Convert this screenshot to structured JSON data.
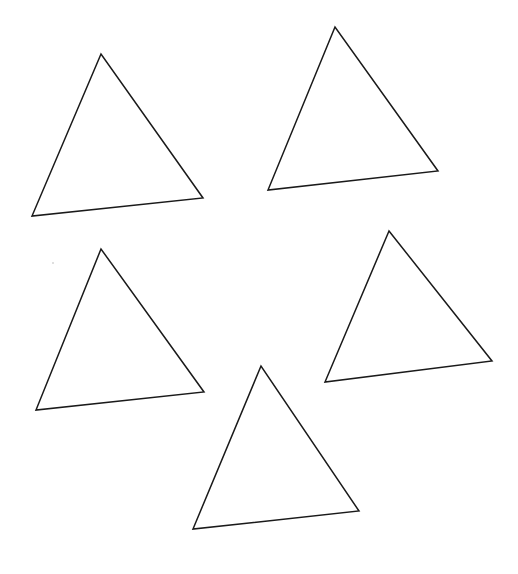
{
  "canvas": {
    "width": 518,
    "height": 574,
    "background_color": "#ffffff",
    "title": "Five Triangles"
  },
  "style": {
    "stroke_color": "#1a1a1a",
    "stroke_width": 1.5,
    "fill": "none"
  },
  "artifacts": [
    {
      "name": "speck-mark",
      "x": 53,
      "y": 263,
      "r": 1.1,
      "color": "#d8d8d8"
    }
  ],
  "shapes": [
    {
      "name": "triangle-top-left",
      "label": "Triangle 1",
      "points": "101,54 32,216 203,198",
      "vertices": [
        [
          101,
          54
        ],
        [
          32,
          216
        ],
        [
          203,
          198
        ]
      ]
    },
    {
      "name": "triangle-top-right",
      "label": "Triangle 2",
      "points": "335,27 268,190 438,171",
      "vertices": [
        [
          335,
          27
        ],
        [
          268,
          190
        ],
        [
          438,
          171
        ]
      ]
    },
    {
      "name": "triangle-middle-left",
      "label": "Triangle 3",
      "points": "101,249 36,410 204,392",
      "vertices": [
        [
          101,
          249
        ],
        [
          36,
          410
        ],
        [
          204,
          392
        ]
      ]
    },
    {
      "name": "triangle-middle-right",
      "label": "Triangle 4",
      "points": "389,231 325,382 492,361",
      "vertices": [
        [
          389,
          231
        ],
        [
          325,
          382
        ],
        [
          492,
          361
        ]
      ]
    },
    {
      "name": "triangle-bottom-center",
      "label": "Triangle 5",
      "points": "261,366 193,529 359,511",
      "vertices": [
        [
          261,
          366
        ],
        [
          193,
          529
        ],
        [
          359,
          511
        ]
      ]
    }
  ]
}
